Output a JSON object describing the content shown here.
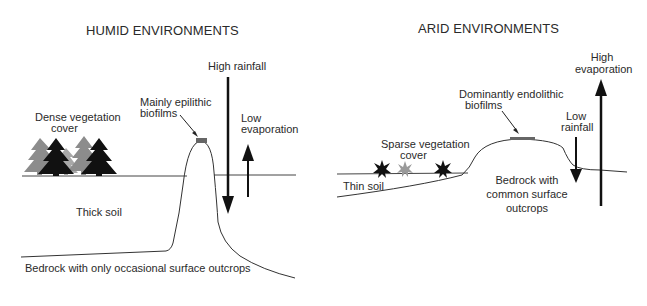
{
  "humid": {
    "title": "HUMID ENVIRONMENTS",
    "labels": {
      "vegetation_line1": "Dense vegetation",
      "vegetation_line2": "cover",
      "biofilm_line1": "Mainly epilithic",
      "biofilm_line2": "biofilms",
      "rainfall": "High rainfall",
      "evaporation_line1": "Low",
      "evaporation_line2": "evaporation",
      "soil": "Thick soil",
      "bedrock": "Bedrock with only occasional surface outcrops"
    },
    "icons": [
      "conifer-tree-icon",
      "down-arrow-icon",
      "up-arrow-icon",
      "pointer-arrow-icon"
    ],
    "colors": {
      "tree_dark": "#111111",
      "tree_light": "#8c8c8c",
      "biofilm": "#666666",
      "line": "#333333"
    }
  },
  "arid": {
    "title": "ARID ENVIRONMENTS",
    "labels": {
      "vegetation_line1": "Sparse vegetation",
      "vegetation_line2": "cover",
      "biofilm_line1": "Dominantly endolithic",
      "biofilm_line2": "biofilms",
      "rainfall_line1": "Low",
      "rainfall_line2": "rainfall",
      "evaporation_line1": "High",
      "evaporation_line2": "evaporation",
      "soil": "Thin soil",
      "bedrock_line1": "Bedrock with",
      "bedrock_line2": "common surface",
      "bedrock_line3": "outcrops"
    },
    "icons": [
      "shrub-icon",
      "down-arrow-icon",
      "up-arrow-icon",
      "pointer-arrow-icon"
    ],
    "colors": {
      "shrub_dark": "#111111",
      "shrub_light": "#9a9a9a",
      "biofilm": "#666666",
      "line": "#333333"
    }
  }
}
